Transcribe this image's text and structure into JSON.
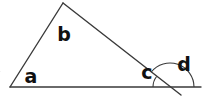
{
  "figure": {
    "background_color": "#ffffff",
    "stroke_color": "#3a3a3a",
    "label_color": "#111111",
    "stroke_width": 1.4
  },
  "labels": {
    "a": "a",
    "b": "b",
    "c": "c",
    "d": "d"
  },
  "label_positions": {
    "a": {
      "x": 31,
      "y": 77
    },
    "b": {
      "x": 64,
      "y": 35
    },
    "c": {
      "x": 147,
      "y": 73
    },
    "d": {
      "x": 184,
      "y": 65
    }
  },
  "vertices": {
    "left": {
      "x": 10,
      "y": 87
    },
    "apex": {
      "x": 63,
      "y": 3
    },
    "right": {
      "x": 170,
      "y": 87
    },
    "baseline_end": {
      "x": 201,
      "y": 87
    },
    "transversal_end": {
      "x": 181,
      "y": 95
    }
  },
  "segments": [
    {
      "name": "baseline",
      "x1": 10,
      "y1": 87,
      "x2": 201,
      "y2": 87
    },
    {
      "name": "left-side",
      "x1": 10,
      "y1": 87,
      "x2": 63,
      "y2": 3
    },
    {
      "name": "transversal",
      "x1": 63,
      "y1": 3,
      "x2": 181,
      "y2": 95
    }
  ],
  "angle_arcs": {
    "a": {
      "cx": 10,
      "cy": 87,
      "r": 19,
      "start_deg": 180,
      "end_deg": 122
    },
    "b": {
      "cx": 63,
      "cy": 3,
      "r": 20,
      "start_deg": 58,
      "end_deg": 142
    },
    "c": {
      "cx": 170,
      "cy": 87,
      "r": 17,
      "start_deg": 180,
      "end_deg": 142
    },
    "d": {
      "cx": 170,
      "cy": 87,
      "r": 24,
      "start_deg": 142,
      "end_deg": 0
    }
  }
}
